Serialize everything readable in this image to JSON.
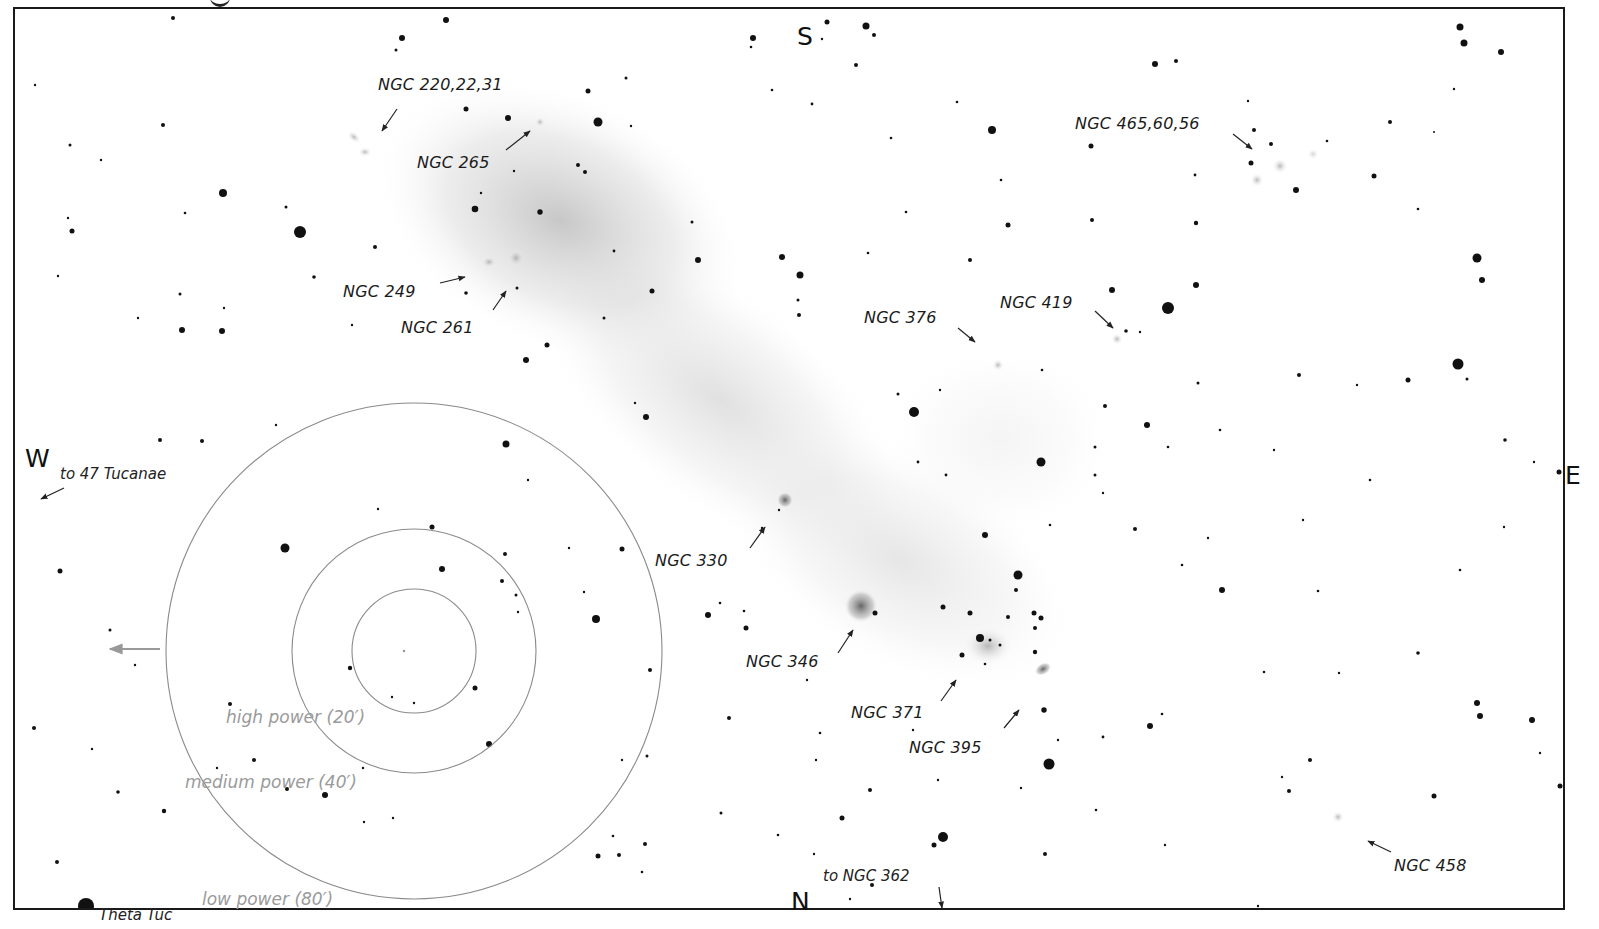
{
  "chart": {
    "type": "finder-chart",
    "colors": {
      "background": "#ffffff",
      "stars": "#111111",
      "galaxy_glow": "#9a9a9a",
      "fov_circles": "#8a8a8a",
      "fov_labels": "#9a9a9a",
      "frame": "#1a1a1a"
    }
  },
  "directions": {
    "south": "S",
    "north": "N",
    "west": "W",
    "east": "E"
  },
  "pointers": {
    "west": "to 47 Tucanae",
    "north": "to NGC 362",
    "bright_star": "Theta Tuc"
  },
  "objects": [
    {
      "id": "ngc220",
      "label": "NGC 220,22,31"
    },
    {
      "id": "ngc265",
      "label": "NGC 265"
    },
    {
      "id": "ngc249",
      "label": "NGC 249"
    },
    {
      "id": "ngc261",
      "label": "NGC 261"
    },
    {
      "id": "ngc376",
      "label": "NGC 376"
    },
    {
      "id": "ngc419",
      "label": "NGC 419"
    },
    {
      "id": "ngc465",
      "label": "NGC 465,60,56"
    },
    {
      "id": "ngc330",
      "label": "NGC 330"
    },
    {
      "id": "ngc346",
      "label": "NGC 346"
    },
    {
      "id": "ngc371",
      "label": "NGC 371"
    },
    {
      "id": "ngc395",
      "label": "NGC 395"
    },
    {
      "id": "ngc458",
      "label": "NGC 458"
    }
  ],
  "fields_of_view": [
    {
      "id": "high",
      "label": "high power (20′)",
      "radius_px": 62
    },
    {
      "id": "medium",
      "label": "medium power (40′)",
      "radius_px": 122
    },
    {
      "id": "low",
      "label": "low power (80′)",
      "radius_px": 248
    }
  ]
}
